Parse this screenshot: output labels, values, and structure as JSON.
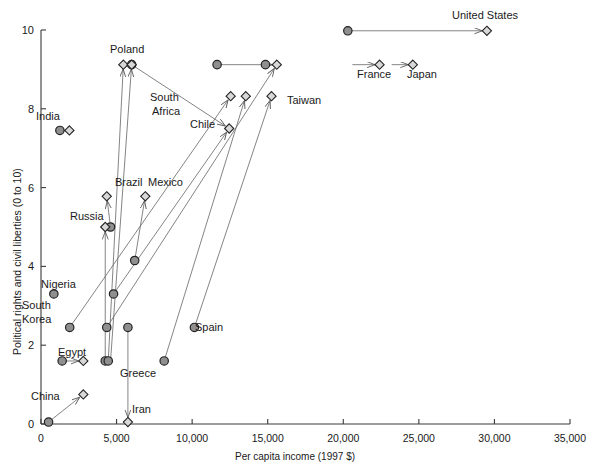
{
  "chart_data": {
    "type": "scatter",
    "title": "",
    "xlabel": "Per capita income (1997 $)",
    "ylabel": "Political rights and civil liberties (0 to 10)",
    "xlim": [
      0,
      35000
    ],
    "ylim": [
      0,
      10
    ],
    "xticks": [
      0,
      5000,
      10000,
      15000,
      20000,
      25000,
      30000,
      35000
    ],
    "xticklabels": [
      "0",
      "5,000",
      "10,000",
      "15,000",
      "20,000",
      "25,000",
      "30,000",
      "35,000"
    ],
    "yticks": [
      0,
      2,
      4,
      6,
      8,
      10
    ],
    "yticklabels": [
      "0",
      "2",
      "4",
      "6",
      "8",
      "10"
    ],
    "grid": false,
    "legend": "none",
    "marker_start": "circle",
    "marker_end": "diamond",
    "connector": "arrow",
    "series": [
      {
        "name": "United States",
        "start": [
          20300,
          9.98
        ],
        "end": [
          29500,
          9.98
        ],
        "label": "United States",
        "label_pos": [
          452,
          14
        ]
      },
      {
        "name": "South Africa",
        "start": [
          11650,
          9.12
        ],
        "end": [
          11650,
          9.12
        ],
        "label": "South Africa",
        "label_pos": [
          151,
          92
        ]
      },
      {
        "name": "Taiwan-line",
        "start": [
          14850,
          9.12
        ],
        "end": [
          15600,
          9.12
        ],
        "label": "Taiwan",
        "label_pos": [
          288,
          96
        ]
      },
      {
        "name": "Poland",
        "start": [
          6000,
          9.12
        ],
        "end": [
          5450,
          9.12
        ],
        "label": "Poland",
        "label_pos": [
          110,
          44
        ]
      },
      {
        "name": "France",
        "start": [
          21900,
          9.12
        ],
        "end": [
          22400,
          9.12
        ],
        "label": "France",
        "label_pos": [
          356,
          70
        ]
      },
      {
        "name": "Japan",
        "start": [
          24100,
          9.12
        ],
        "end": [
          24600,
          9.12
        ],
        "label": "Japan",
        "label_pos": [
          406,
          70
        ]
      },
      {
        "name": "Chile",
        "start": [
          6400,
          2.45
        ],
        "end": [
          12450,
          8.32
        ],
        "label": "Chile",
        "label_pos": [
          191,
          93
        ]
      },
      {
        "name": "India",
        "start": [
          1250,
          7.45
        ],
        "end": [
          1880,
          7.45
        ],
        "label": "India",
        "label_pos": [
          35,
          111
        ]
      },
      {
        "name": "Brazil",
        "start": [
          4600,
          5.0
        ],
        "end": [
          4350,
          5.78
        ],
        "label": "Brazil",
        "label_pos": [
          116,
          176
        ]
      },
      {
        "name": "Mexico",
        "start": [
          6200,
          4.15
        ],
        "end": [
          6900,
          5.78
        ],
        "label": "Mexico",
        "label_pos": [
          148,
          176
        ]
      },
      {
        "name": "Russia",
        "start": [
          4250,
          1.6
        ],
        "end": [
          4250,
          5.0
        ],
        "label": "Russia",
        "label_pos": [
          70,
          211
        ]
      },
      {
        "name": "Nigeria",
        "start": [
          850,
          3.3
        ],
        "end": [
          850,
          3.3
        ],
        "label": "Nigeria",
        "label_pos": [
          41,
          278
        ]
      },
      {
        "name": "South Korea",
        "start": [
          1900,
          2.45
        ],
        "end": [
          15250,
          8.32
        ],
        "label": "South\nKorea",
        "label_pos": [
          22,
          300
        ]
      },
      {
        "name": "Egypt",
        "start": [
          1400,
          1.6
        ],
        "end": [
          2800,
          1.6
        ],
        "label": "Egypt",
        "label_pos": [
          58,
          347
        ]
      },
      {
        "name": "Spain",
        "start": [
          10150,
          2.45
        ],
        "end": [
          15250,
          9.12
        ],
        "label": "Spain",
        "label_pos": [
          196,
          321
        ]
      },
      {
        "name": "Greece",
        "start": [
          8150,
          1.6
        ],
        "end": [
          12450,
          8.32
        ],
        "label": "Greece",
        "label_pos": [
          123,
          368
        ]
      },
      {
        "name": "China",
        "start": [
          500,
          0.05
        ],
        "end": [
          2800,
          0.75
        ],
        "label": "China",
        "label_pos": [
          31,
          390
        ]
      },
      {
        "name": "Iran",
        "start": [
          5750,
          2.45
        ],
        "end": [
          5750,
          0.05
        ],
        "label": "Iran",
        "label_pos": [
          132,
          404
        ]
      }
    ],
    "circles": [
      {
        "name": "united-states-start",
        "x": 20300,
        "y": 9.98
      },
      {
        "name": "south-africa-start",
        "x": 11650,
        "y": 9.12
      },
      {
        "name": "taiwan-start",
        "x": 14850,
        "y": 9.12
      },
      {
        "name": "poland-start",
        "x": 6000,
        "y": 9.12
      },
      {
        "name": "india-start",
        "x": 1250,
        "y": 7.45
      },
      {
        "name": "brazil-start",
        "x": 4600,
        "y": 5.0
      },
      {
        "name": "mexico-start",
        "x": 6200,
        "y": 4.15
      },
      {
        "name": "nigeria-start",
        "x": 850,
        "y": 3.3
      },
      {
        "name": "chile-start",
        "x": 4800,
        "y": 3.3
      },
      {
        "name": "south-korea-start",
        "x": 1900,
        "y": 2.45
      },
      {
        "name": "taiwan-origin",
        "x": 4350,
        "y": 2.45
      },
      {
        "name": "iran-start",
        "x": 5750,
        "y": 2.45
      },
      {
        "name": "spain-start",
        "x": 10150,
        "y": 2.45
      },
      {
        "name": "egypt-start",
        "x": 1400,
        "y": 1.6
      },
      {
        "name": "russia-start",
        "x": 4250,
        "y": 1.6
      },
      {
        "name": "poland-origin",
        "x": 4450,
        "y": 1.6
      },
      {
        "name": "greece-start",
        "x": 8150,
        "y": 1.6
      },
      {
        "name": "china-start",
        "x": 500,
        "y": 0.05
      }
    ],
    "diamonds": [
      {
        "name": "united-states-end",
        "x": 29500,
        "y": 9.98
      },
      {
        "name": "poland-end",
        "x": 5450,
        "y": 9.12
      },
      {
        "name": "south-africa-end",
        "x": 6000,
        "y": 9.12
      },
      {
        "name": "taiwan-end",
        "x": 15600,
        "y": 9.12
      },
      {
        "name": "france-end",
        "x": 22400,
        "y": 9.12
      },
      {
        "name": "japan-end",
        "x": 24600,
        "y": 9.12
      },
      {
        "name": "south-korea-end",
        "x": 12550,
        "y": 8.32
      },
      {
        "name": "greece-end",
        "x": 13550,
        "y": 8.32
      },
      {
        "name": "taiwan-mid",
        "x": 15250,
        "y": 8.32
      },
      {
        "name": "chile-end",
        "x": 12450,
        "y": 7.5
      },
      {
        "name": "india-end",
        "x": 1880,
        "y": 7.45
      },
      {
        "name": "brazil-end",
        "x": 4350,
        "y": 5.78
      },
      {
        "name": "mexico-end",
        "x": 6900,
        "y": 5.78
      },
      {
        "name": "russia-end",
        "x": 4250,
        "y": 5.0
      },
      {
        "name": "egypt-end",
        "x": 2800,
        "y": 1.6
      },
      {
        "name": "china-end",
        "x": 2800,
        "y": 0.75
      },
      {
        "name": "iran-end",
        "x": 5750,
        "y": 0.05
      }
    ],
    "arrows": [
      {
        "name": "united-states",
        "from": [
          20300,
          9.98
        ],
        "to": [
          29500,
          9.98
        ]
      },
      {
        "name": "south-africa-to-chile",
        "from": [
          6000,
          9.12
        ],
        "to": [
          12450,
          7.5
        ]
      },
      {
        "name": "taiwan-line",
        "from": [
          11650,
          9.12
        ],
        "to": [
          15600,
          9.12
        ]
      },
      {
        "name": "france",
        "from": [
          20600,
          9.12
        ],
        "to": [
          22400,
          9.12
        ]
      },
      {
        "name": "japan",
        "from": [
          23200,
          9.12
        ],
        "to": [
          24600,
          9.12
        ]
      },
      {
        "name": "poland-up",
        "from": [
          4450,
          1.6
        ],
        "to": [
          5450,
          9.12
        ]
      },
      {
        "name": "poland-up-2",
        "from": [
          4600,
          1.6
        ],
        "to": [
          6000,
          9.12
        ]
      },
      {
        "name": "taiwan-up",
        "from": [
          4350,
          2.45
        ],
        "to": [
          15600,
          9.12
        ]
      },
      {
        "name": "korea-up",
        "from": [
          1900,
          2.45
        ],
        "to": [
          12550,
          8.32
        ]
      },
      {
        "name": "greece-up",
        "from": [
          8150,
          1.6
        ],
        "to": [
          13550,
          8.32
        ]
      },
      {
        "name": "spain-up",
        "from": [
          10150,
          2.45
        ],
        "to": [
          15250,
          8.32
        ]
      },
      {
        "name": "chile-up",
        "from": [
          4800,
          3.3
        ],
        "to": [
          12450,
          7.5
        ]
      },
      {
        "name": "india",
        "from": [
          1250,
          7.45
        ],
        "to": [
          1880,
          7.45
        ]
      },
      {
        "name": "brazil-up",
        "from": [
          4600,
          5.0
        ],
        "to": [
          4350,
          5.78
        ]
      },
      {
        "name": "mexico-up",
        "from": [
          6200,
          4.15
        ],
        "to": [
          6900,
          5.78
        ]
      },
      {
        "name": "russia-up",
        "from": [
          4250,
          1.6
        ],
        "to": [
          4250,
          5.0
        ]
      },
      {
        "name": "egypt",
        "from": [
          1400,
          1.6
        ],
        "to": [
          2800,
          1.6
        ]
      },
      {
        "name": "china",
        "from": [
          500,
          0.05
        ],
        "to": [
          2800,
          0.75
        ]
      },
      {
        "name": "iran-down",
        "from": [
          5750,
          2.45
        ],
        "to": [
          5750,
          0.05
        ]
      }
    ]
  },
  "labels": {
    "united_states": "United States",
    "poland": "Poland",
    "south_africa_1": "South",
    "south_africa_2": "Africa",
    "france": "France",
    "japan": "Japan",
    "taiwan": "Taiwan",
    "chile": "Chile",
    "india": "India",
    "brazil": "Brazil",
    "mexico": "Mexico",
    "russia": "Russia",
    "nigeria": "Nigeria",
    "south_korea_1": "South",
    "south_korea_2": "Korea",
    "egypt": "Egypt",
    "spain": "Spain",
    "greece": "Greece",
    "china": "China",
    "iran": "Iran"
  },
  "axes": {
    "x_title": "Per capita income (1997 $)",
    "y_title": "Political rights and civil liberties (0 to 10)",
    "x_ticks": [
      "0",
      "5,000",
      "10,000",
      "15,000",
      "20,000",
      "25,000",
      "30,000",
      "35,000"
    ],
    "y_ticks": [
      "0",
      "2",
      "4",
      "6",
      "8",
      "10"
    ]
  },
  "colors": {
    "axis": "#3a3a3a",
    "marker_fill": "#8f8f8f",
    "marker_edge": "#222222",
    "diamond_fill": "#d8d8d8",
    "line": "#6e6e6e",
    "text": "#1a1a1a"
  }
}
